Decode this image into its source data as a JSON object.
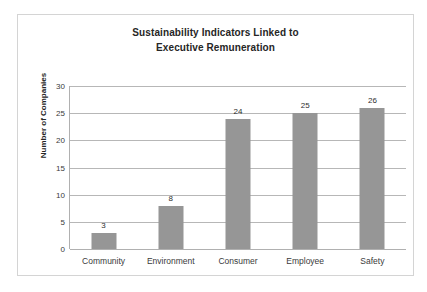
{
  "chart_data": {
    "type": "bar",
    "title": "Sustainability Indicators Linked to Executive Remuneration",
    "title_lines": [
      "Sustainability Indicators Linked to",
      "Executive Remuneration"
    ],
    "categories": [
      "Community",
      "Environment",
      "Consumer",
      "Employee",
      "Safety"
    ],
    "values": [
      3,
      8,
      24,
      25,
      26
    ],
    "value_labels": [
      "3",
      "8",
      "24",
      "25",
      "26"
    ],
    "xlabel": "",
    "ylabel": "Number of Companies",
    "ylim": [
      0,
      30
    ],
    "ytick_labels": [
      "0",
      "5",
      "10",
      "15",
      "20",
      "25",
      "30"
    ],
    "ytick_values": [
      0,
      5,
      10,
      15,
      20,
      25,
      30
    ],
    "grid": true,
    "legend": false,
    "bar_color": "#969696",
    "gridline_color": "#b7b7b7",
    "axis_color": "#b0b0b0",
    "border_color": "#d4d4d4",
    "background_color": "#ffffff",
    "text_color": "#2b2b2b"
  }
}
